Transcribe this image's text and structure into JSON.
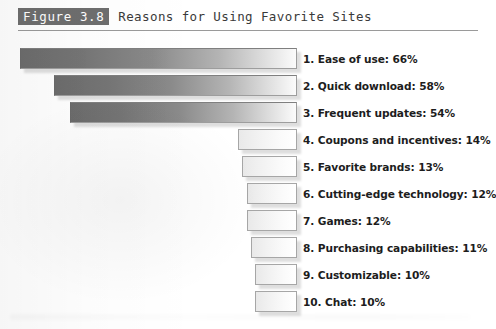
{
  "figure": {
    "badge": "Figure 3.8",
    "title": "Reasons for Using Favorite Sites"
  },
  "chart_data": {
    "type": "bar",
    "orientation": "horizontal",
    "title": "Reasons for Using Favorite Sites",
    "xlabel": "",
    "ylabel": "",
    "xlim": [
      0,
      66
    ],
    "grid": false,
    "legend": false,
    "value_unit": "%",
    "categories": [
      "Ease of use",
      "Quick download",
      "Frequent updates",
      "Coupons and incentives",
      "Favorite brands",
      "Cutting-edge technology",
      "Games",
      "Purchasing capabilities",
      "Customizable",
      "Chat"
    ],
    "values": [
      66,
      58,
      54,
      14,
      13,
      12,
      12,
      11,
      10,
      10
    ],
    "labels": [
      "1. Ease of use: 66%",
      "2. Quick download: 58%",
      "3. Frequent updates: 54%",
      "4. Coupons and incentives: 14%",
      "5. Favorite brands: 13%",
      "6. Cutting-edge technology: 12%",
      "7. Games: 12%",
      "8. Purchasing capabilities: 11%",
      "9. Customizable: 10%",
      "10. Chat: 10%"
    ],
    "bar_style": [
      "big",
      "big",
      "big",
      "small",
      "small",
      "small",
      "small",
      "small",
      "small",
      "small"
    ],
    "colors": {
      "bar_gradient_start": "#6c6c6c",
      "bar_gradient_end": "#ffffff",
      "bar_border": "#a6a6a6",
      "badge_background": "#6e6e6e",
      "badge_text": "#ffffff",
      "label_text": "#1d1d1d",
      "rule": "#9a9a9a"
    }
  }
}
